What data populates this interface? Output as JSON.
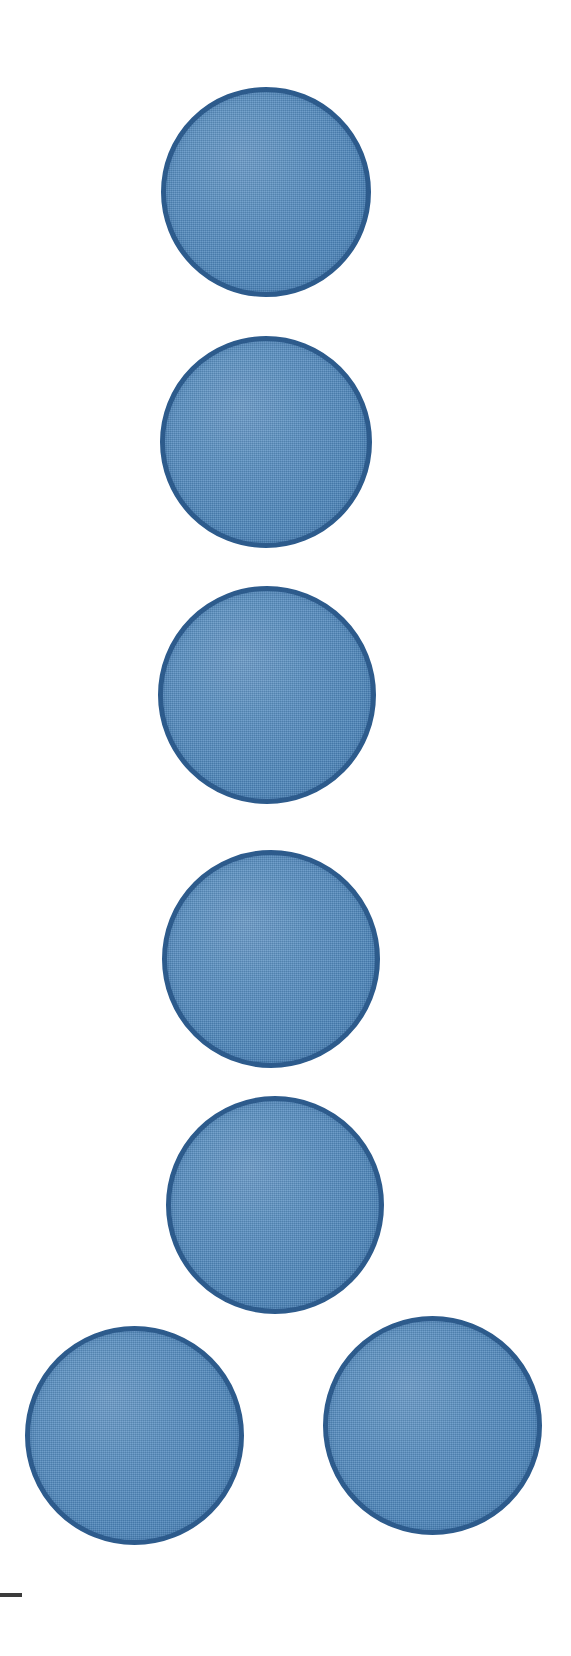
{
  "figure": {
    "canvas": {
      "width": 571,
      "height": 1656
    },
    "background_color": "#ffffff",
    "disc_fill_color": "#4d87bd",
    "disc_stroke_color": "#2d5b8c",
    "scale_bar_color": "#3b3b3b",
    "disc_count": 7
  },
  "discs": [
    {
      "label": "disc-1",
      "x": 161,
      "y": 87,
      "diameter": 210,
      "stroke_width": 5,
      "fill": "#4d87bd",
      "stroke": "#2d5b8c"
    },
    {
      "label": "disc-2",
      "x": 160,
      "y": 336,
      "diameter": 212,
      "stroke_width": 5,
      "fill": "#4d87bd",
      "stroke": "#2d5b8c"
    },
    {
      "label": "disc-3",
      "x": 158,
      "y": 586,
      "diameter": 218,
      "stroke_width": 5,
      "fill": "#4d87bd",
      "stroke": "#2d5b8c"
    },
    {
      "label": "disc-4",
      "x": 162,
      "y": 850,
      "diameter": 218,
      "stroke_width": 5,
      "fill": "#4d87bd",
      "stroke": "#2d5b8c"
    },
    {
      "label": "disc-5",
      "x": 166,
      "y": 1096,
      "diameter": 218,
      "stroke_width": 5,
      "fill": "#4d87bd",
      "stroke": "#2d5b8c"
    },
    {
      "label": "disc-6",
      "x": 25,
      "y": 1326,
      "diameter": 219,
      "stroke_width": 5,
      "fill": "#4d87bd",
      "stroke": "#2d5b8c"
    },
    {
      "label": "disc-7",
      "x": 323,
      "y": 1316,
      "diameter": 219,
      "stroke_width": 5,
      "fill": "#4d87bd",
      "stroke": "#2d5b8c"
    }
  ],
  "scale_bar": {
    "x": 0,
    "y": 1593,
    "width": 22,
    "height": 4,
    "color": "#3b3b3b",
    "caption": ""
  },
  "chart_data": {
    "type": "scatter",
    "title": "",
    "subtitle": "",
    "xlabel": "",
    "ylabel": "",
    "xlim": [
      0,
      571
    ],
    "ylim": [
      0,
      1656
    ],
    "grid": false,
    "legend": [],
    "annotations": [],
    "marker": {
      "shape": "circle",
      "fill_color": "#4d87bd",
      "edge_color": "#2d5b8c",
      "edge_width": 5,
      "texture": "woven-fabric"
    },
    "points": [
      {
        "id": 1,
        "x": 266,
        "y": 192,
        "diameter": 210
      },
      {
        "id": 2,
        "x": 266,
        "y": 442,
        "diameter": 212
      },
      {
        "id": 3,
        "x": 267,
        "y": 695,
        "diameter": 218
      },
      {
        "id": 4,
        "x": 271,
        "y": 959,
        "diameter": 218
      },
      {
        "id": 5,
        "x": 275,
        "y": 1205,
        "diameter": 218
      },
      {
        "id": 6,
        "x": 134,
        "y": 1435,
        "diameter": 219
      },
      {
        "id": 7,
        "x": 432,
        "y": 1425,
        "diameter": 219
      }
    ]
  }
}
